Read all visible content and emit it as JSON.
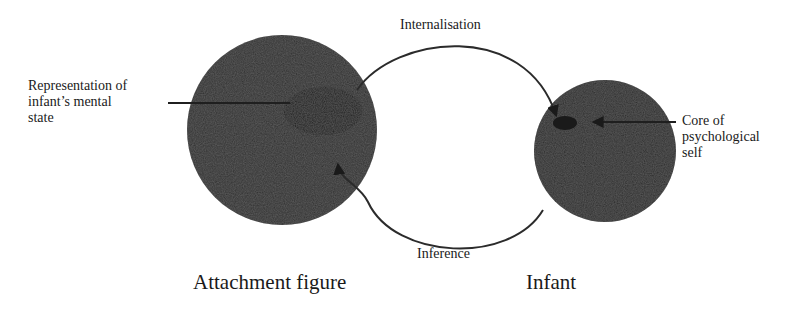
{
  "diagram": {
    "labels": {
      "representation": [
        "Representation of",
        "infant’s mental",
        "state"
      ],
      "internalisation": "Internalisation",
      "inference": "Inference",
      "core": [
        "Core of",
        "psychological",
        "self"
      ],
      "attachment_figure": "Attachment figure",
      "infant": "Infant"
    },
    "nodes": [
      {
        "id": "attachment-figure",
        "label": "Attachment figure",
        "shape": "circle",
        "fill": "#2e2e2e"
      },
      {
        "id": "infant",
        "label": "Infant",
        "shape": "circle",
        "fill": "#2a2a2a"
      },
      {
        "id": "representation",
        "label": "Representation of infant's mental state",
        "shape": "ellipse",
        "parent": "attachment-figure",
        "fill": "#1c1c1c"
      },
      {
        "id": "core-self",
        "label": "Core of psychological self",
        "shape": "ellipse",
        "parent": "infant",
        "fill": "#1c1c1c"
      }
    ],
    "edges": [
      {
        "from": "representation",
        "to": "core-self",
        "label": "Internalisation",
        "path": "upper-arc"
      },
      {
        "from": "infant",
        "to": "representation",
        "label": "Inference",
        "path": "lower-arc"
      }
    ],
    "colors": {
      "circle_fill": "#2e2e2e",
      "inner_fill": "#1a1a1a",
      "line": "#2b2b2b",
      "background": "#ffffff"
    }
  }
}
